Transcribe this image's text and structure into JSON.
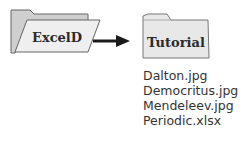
{
  "source_folder": {
    "label": "ExcelD",
    "icon": "open-folder-icon"
  },
  "arrow": {
    "direction": "right"
  },
  "target_folder": {
    "label": "Tutorial",
    "icon": "closed-folder-icon"
  },
  "files": [
    {
      "name": "Dalton.jpg"
    },
    {
      "name": "Democritus.jpg"
    },
    {
      "name": "Mendeleev.jpg"
    },
    {
      "name": "Periodic.xlsx"
    }
  ],
  "colors": {
    "folder_back": "#cfcfcf",
    "folder_front": "#efefef",
    "outline": "#666666",
    "arrow": "#1a1a1a",
    "text": "#333333"
  }
}
